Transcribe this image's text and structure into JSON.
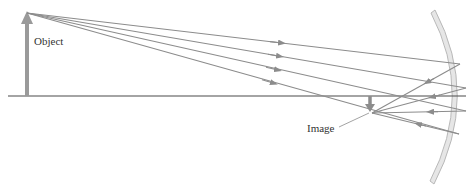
{
  "diagram": {
    "labels": {
      "object": "Object",
      "image": "Image"
    },
    "colors": {
      "ray": "#8c8c8c",
      "axis": "#4a4a4a",
      "object_arrow": "#9a9a9a",
      "mirror_fill": "#e6e6e6",
      "mirror_stroke": "#b8b8b8",
      "label_text": "#333333"
    },
    "axis": {
      "x1": 8,
      "y": 96,
      "x2": 466
    },
    "object": {
      "x": 27,
      "base_y": 96,
      "tip_y": 13
    },
    "image": {
      "x": 370,
      "base_y": 96,
      "tip_y": 111
    },
    "mirror": {
      "top": [
        435,
        10
      ],
      "bulge": [
        471,
        96
      ],
      "bottom": [
        434,
        184
      ]
    },
    "incident_rays": [
      {
        "from": [
          27,
          13
        ],
        "to": [
          460,
          64
        ]
      },
      {
        "from": [
          27,
          13
        ],
        "to": [
          466,
          88
        ]
      },
      {
        "from": [
          27,
          13
        ],
        "to": [
          466,
          111
        ]
      },
      {
        "from": [
          27,
          13
        ],
        "to": [
          459,
          134
        ]
      }
    ],
    "reflected_rays": [
      {
        "from": [
          460,
          64
        ],
        "to": [
          372,
          113
        ]
      },
      {
        "from": [
          466,
          88
        ],
        "to": [
          372,
          113
        ]
      },
      {
        "from": [
          466,
          111
        ],
        "to": [
          372,
          113
        ]
      },
      {
        "from": [
          459,
          134
        ],
        "to": [
          372,
          113
        ]
      }
    ]
  }
}
